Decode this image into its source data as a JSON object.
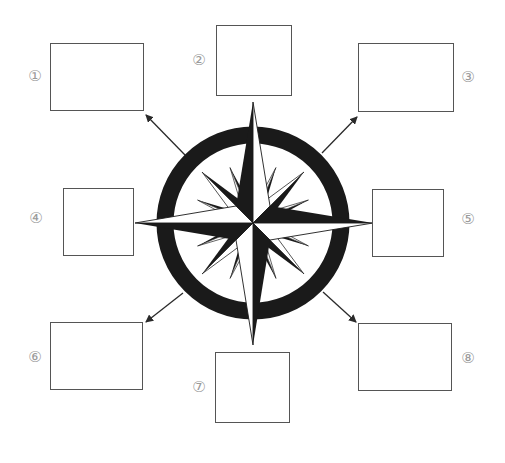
{
  "diagram": {
    "type": "compass-rose-worksheet",
    "colors": {
      "ink": "#1a1a1a",
      "box_border": "#555555",
      "label": "#9a9a9a",
      "background": "#ffffff"
    },
    "boxes": [
      {
        "id": 1,
        "label": "①",
        "x": 50,
        "y": 43,
        "w": 94,
        "h": 68,
        "lx": 35,
        "ly": 76
      },
      {
        "id": 2,
        "label": "②",
        "x": 216,
        "y": 25,
        "w": 76,
        "h": 71,
        "lx": 199,
        "ly": 60
      },
      {
        "id": 3,
        "label": "③",
        "x": 358,
        "y": 43,
        "w": 96,
        "h": 69,
        "lx": 468,
        "ly": 77
      },
      {
        "id": 4,
        "label": "④",
        "x": 63,
        "y": 188,
        "w": 71,
        "h": 68,
        "lx": 36,
        "ly": 218
      },
      {
        "id": 5,
        "label": "⑤",
        "x": 372,
        "y": 189,
        "w": 72,
        "h": 68,
        "lx": 468,
        "ly": 219
      },
      {
        "id": 6,
        "label": "⑥",
        "x": 50,
        "y": 322,
        "w": 93,
        "h": 68,
        "lx": 35,
        "ly": 357
      },
      {
        "id": 7,
        "label": "⑦",
        "x": 215,
        "y": 352,
        "w": 75,
        "h": 71,
        "lx": 199,
        "ly": 387
      },
      {
        "id": 8,
        "label": "⑧",
        "x": 358,
        "y": 323,
        "w": 94,
        "h": 68,
        "lx": 468,
        "ly": 358
      }
    ],
    "compass": {
      "cx": 253,
      "cy": 223,
      "ring_outer": 96,
      "ring_inner": 80
    },
    "arrows": [
      {
        "to": "box-1",
        "direction": "northwest"
      },
      {
        "to": "box-3",
        "direction": "northeast"
      },
      {
        "to": "box-6",
        "direction": "southwest"
      },
      {
        "to": "box-8",
        "direction": "southeast"
      }
    ]
  }
}
